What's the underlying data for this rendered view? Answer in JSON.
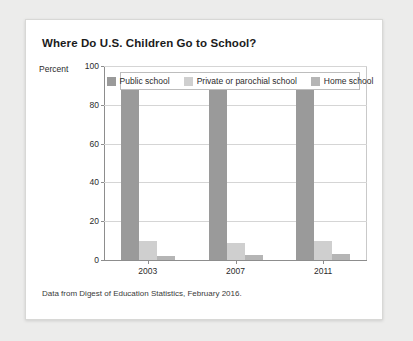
{
  "card": {
    "title": "Where Do U.S. Children Go to School?",
    "source_note": "Data from Digest of Education Statistics, February 2016."
  },
  "axis": {
    "percent_label": "Percent",
    "ytick_labels": [
      "100",
      "80",
      "60",
      "40",
      "20",
      "0"
    ]
  },
  "legend": {
    "items": [
      {
        "label": "Public school",
        "color": "#9a9a9a",
        "swatch_icon": "legend-swatch-icon"
      },
      {
        "label": "Private or parochial school",
        "color": "#cfcfcf",
        "swatch_icon": "legend-swatch-icon"
      },
      {
        "label": "Home school",
        "color": "#b5b5b5",
        "swatch_icon": "legend-swatch-icon"
      }
    ]
  },
  "chart_data": {
    "type": "bar",
    "title": "Where Do U.S. Children Go to School?",
    "xlabel": "",
    "ylabel": "Percent",
    "ylim": [
      0,
      100
    ],
    "yticks": [
      0,
      20,
      40,
      60,
      80,
      100
    ],
    "grid": true,
    "legend_position": "top-inside",
    "categories": [
      "2003",
      "2007",
      "2011"
    ],
    "series": [
      {
        "name": "Public school",
        "color": "#9a9a9a",
        "values": [
          88,
          88,
          88
        ]
      },
      {
        "name": "Private or parochial school",
        "color": "#cfcfcf",
        "values": [
          10,
          9,
          10
        ]
      },
      {
        "name": "Home school",
        "color": "#b5b5b5",
        "values": [
          2,
          2.5,
          3
        ]
      }
    ],
    "annotations": [
      "Data from Digest of Education Statistics, February 2016."
    ]
  }
}
